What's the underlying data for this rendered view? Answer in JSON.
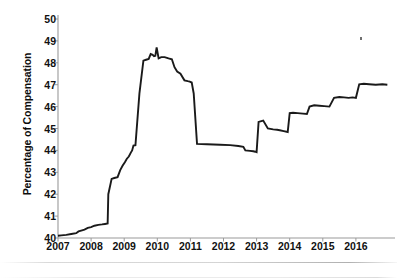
{
  "chart_data": {
    "type": "line",
    "title": "",
    "xlabel": "",
    "ylabel": "Percentage of Compensation",
    "xlim": [
      2007.0,
      2017.0
    ],
    "ylim": [
      40,
      50
    ],
    "yticks": [
      40,
      41,
      42,
      43,
      44,
      45,
      46,
      47,
      48,
      49,
      50
    ],
    "xticks": [
      2007,
      2008,
      2009,
      2010,
      2011,
      2012,
      2013,
      2014,
      2015,
      2016
    ],
    "grid": false,
    "legend": null,
    "series": [
      {
        "name": "Percentage of Compensation",
        "color": "#1a1a1a",
        "x": [
          2007.0,
          2007.1,
          2007.25,
          2007.4,
          2007.55,
          2007.62,
          2007.7,
          2007.8,
          2007.9,
          2008.0,
          2008.1,
          2008.22,
          2008.33,
          2008.42,
          2008.5,
          2008.52,
          2008.62,
          2008.7,
          2008.8,
          2008.88,
          2008.95,
          2009.02,
          2009.08,
          2009.14,
          2009.2,
          2009.24,
          2009.28,
          2009.34,
          2009.46,
          2009.58,
          2009.66,
          2009.74,
          2009.8,
          2009.86,
          2009.9,
          2009.94,
          2009.98,
          2010.04,
          2010.12,
          2010.22,
          2010.34,
          2010.44,
          2010.52,
          2010.6,
          2010.7,
          2010.82,
          2010.92,
          2010.98,
          2011.04,
          2011.1,
          2011.2,
          2011.5,
          2011.9,
          2012.2,
          2012.45,
          2012.6,
          2012.66,
          2012.8,
          2012.9,
          2012.96,
          2013.0,
          2013.06,
          2013.2,
          2013.34,
          2013.5,
          2013.62,
          2013.7,
          2013.82,
          2013.94,
          2014.0,
          2014.1,
          2014.24,
          2014.4,
          2014.52,
          2014.6,
          2014.74,
          2014.9,
          2015.04,
          2015.2,
          2015.34,
          2015.5,
          2015.64,
          2015.78,
          2015.9,
          2016.0,
          2016.1,
          2016.24,
          2016.4,
          2016.6,
          2016.8,
          2016.95
        ],
        "y": [
          40.1,
          40.12,
          40.14,
          40.18,
          40.22,
          40.3,
          40.34,
          40.38,
          40.46,
          40.5,
          40.56,
          40.6,
          40.62,
          40.64,
          40.66,
          42.0,
          42.7,
          42.74,
          42.78,
          43.1,
          43.3,
          43.46,
          43.62,
          43.72,
          43.9,
          44.0,
          44.22,
          44.24,
          46.6,
          48.1,
          48.14,
          48.18,
          48.4,
          48.36,
          48.3,
          48.32,
          48.7,
          48.2,
          48.26,
          48.26,
          48.2,
          48.16,
          47.8,
          47.6,
          47.5,
          47.2,
          47.16,
          47.14,
          47.1,
          46.6,
          44.3,
          44.28,
          44.26,
          44.24,
          44.2,
          44.16,
          44.0,
          43.98,
          43.96,
          43.94,
          43.92,
          45.3,
          45.36,
          45.0,
          44.96,
          44.94,
          44.92,
          44.88,
          44.84,
          45.7,
          45.72,
          45.7,
          45.68,
          45.66,
          46.0,
          46.06,
          46.04,
          46.02,
          46.0,
          46.4,
          46.44,
          46.42,
          46.4,
          46.42,
          46.4,
          47.02,
          47.04,
          47.02,
          47.0,
          47.02,
          47.0
        ]
      }
    ],
    "axis": {
      "left_spine": true,
      "bottom_spine": true,
      "right_spine": false,
      "top_spine": false,
      "spine_color": "#9a9a9a",
      "tick_color": "#9a9a9a"
    }
  }
}
